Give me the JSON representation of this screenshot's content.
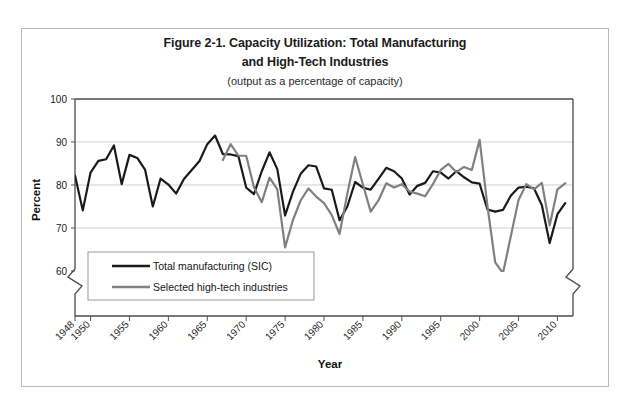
{
  "figure": {
    "title_line1": "Figure 2-1. Capacity Utilization: Total Manufacturing",
    "title_line2": "and High-Tech Industries",
    "subtitle": "(output as a percentage of capacity)",
    "frame_color": "#b9b9b9",
    "background": "#ffffff"
  },
  "chart_data": {
    "type": "line",
    "title": "Figure 2-1. Capacity Utilization: Total Manufacturing and High-Tech Industries",
    "subtitle": "(output as a percentage of capacity)",
    "xlabel": "Year",
    "ylabel": "Percent",
    "xlim": [
      1948,
      2012
    ],
    "ylim": [
      60,
      100
    ],
    "ylim_broken_below": 60,
    "yticks": [
      60,
      70,
      80,
      90,
      100
    ],
    "xticks": [
      1948,
      1950,
      1955,
      1960,
      1965,
      1970,
      1975,
      1980,
      1985,
      1990,
      1995,
      2000,
      2005,
      2010
    ],
    "xtick_labels": [
      "1948",
      "1950",
      "1955",
      "1960",
      "1965",
      "1970",
      "1975",
      "1980",
      "1985",
      "1990",
      "1995",
      "2000",
      "2005",
      "2010"
    ],
    "grid": "horizontal",
    "legend_position": "lower-left",
    "axis_break": true,
    "series": [
      {
        "name": "Total manufacturing (SIC)",
        "color": "#1a1a1a",
        "width": 2.2,
        "x": [
          1948,
          1949,
          1950,
          1951,
          1952,
          1953,
          1954,
          1955,
          1956,
          1957,
          1958,
          1959,
          1960,
          1961,
          1962,
          1963,
          1964,
          1965,
          1966,
          1967,
          1968,
          1969,
          1970,
          1971,
          1972,
          1973,
          1974,
          1975,
          1976,
          1977,
          1978,
          1979,
          1980,
          1981,
          1982,
          1983,
          1984,
          1985,
          1986,
          1987,
          1988,
          1989,
          1990,
          1991,
          1992,
          1993,
          1994,
          1995,
          1996,
          1997,
          1998,
          1999,
          2000,
          2001,
          2002,
          2003,
          2004,
          2005,
          2006,
          2007,
          2008,
          2009,
          2010,
          2011
        ],
        "y": [
          82.2,
          74.1,
          82.9,
          85.6,
          86.0,
          89.2,
          80.2,
          87.0,
          86.3,
          83.6,
          75.0,
          81.5,
          80.1,
          78.0,
          81.4,
          83.5,
          85.6,
          89.5,
          91.5,
          87.2,
          87.1,
          86.7,
          79.4,
          77.9,
          83.2,
          87.6,
          83.7,
          72.9,
          78.4,
          82.6,
          84.6,
          84.3,
          79.2,
          78.9,
          71.8,
          75.0,
          80.7,
          79.4,
          78.9,
          81.4,
          84.0,
          83.2,
          81.5,
          77.8,
          79.8,
          80.5,
          83.2,
          82.9,
          81.5,
          83.2,
          81.8,
          80.6,
          80.3,
          74.3,
          73.8,
          74.2,
          77.5,
          79.4,
          79.6,
          79.2,
          75.3,
          66.5,
          73.2,
          75.8
        ]
      },
      {
        "name": "Selected high-tech industries",
        "color": "#808080",
        "width": 2.2,
        "x": [
          1967,
          1968,
          1969,
          1970,
          1971,
          1972,
          1973,
          1974,
          1975,
          1976,
          1977,
          1978,
          1979,
          1980,
          1981,
          1982,
          1983,
          1984,
          1985,
          1986,
          1987,
          1988,
          1989,
          1990,
          1991,
          1992,
          1993,
          1994,
          1995,
          1996,
          1997,
          1998,
          1999,
          2000,
          2001,
          2002,
          2003,
          2004,
          2005,
          2006,
          2007,
          2008,
          2009,
          2010,
          2011
        ],
        "y": [
          85.8,
          89.5,
          86.8,
          86.8,
          79.5,
          76.0,
          81.7,
          79.0,
          65.5,
          71.8,
          76.4,
          79.2,
          77.3,
          75.8,
          73.0,
          68.6,
          78.0,
          86.5,
          80.1,
          73.8,
          76.4,
          80.4,
          79.4,
          80.2,
          78.5,
          78.0,
          77.4,
          80.2,
          83.5,
          84.9,
          83.0,
          84.2,
          83.5,
          90.5,
          75.2,
          62.0,
          59.5,
          68.0,
          76.5,
          80.2,
          79.0,
          80.5,
          70.6,
          79.0,
          80.4
        ]
      }
    ]
  },
  "legend": {
    "items": [
      {
        "label": "Total manufacturing (SIC)",
        "color": "#1a1a1a"
      },
      {
        "label": "Selected high-tech industries",
        "color": "#808080"
      }
    ]
  }
}
